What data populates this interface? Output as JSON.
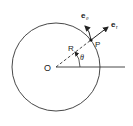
{
  "diagram": {
    "labels": {
      "origin": "O",
      "radius": "R",
      "point": "P",
      "angle": "θ",
      "e_theta_base": "e",
      "e_theta_sub": "θ",
      "e_r_base": "e",
      "e_r_sub": "r"
    },
    "geometry": {
      "center": [
        56,
        67
      ],
      "radius": 44,
      "point": [
        91,
        40
      ],
      "angle_deg": 38
    },
    "colors": {
      "stroke": "#222222",
      "background": "#ffffff"
    }
  }
}
